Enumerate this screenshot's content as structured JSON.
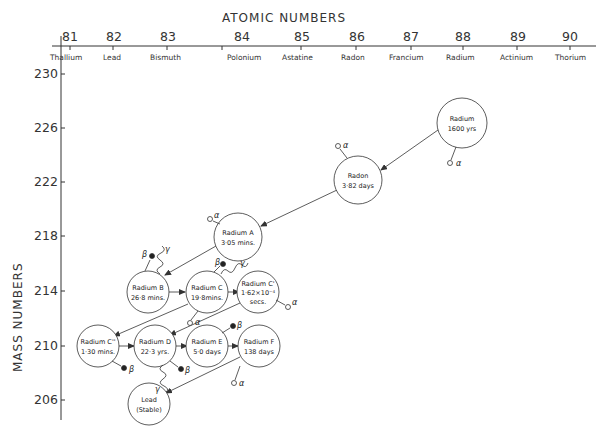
{
  "x_axis": {
    "title": "ATOMIC   NUMBERS",
    "ticks": [
      {
        "num": "81",
        "element": "Thallium",
        "x": 58
      },
      {
        "num": "82",
        "element": "Lead",
        "x": 113
      },
      {
        "num": "83",
        "element": "Bismuth",
        "x": 167
      },
      {
        "num": "84",
        "element": "Polonium",
        "x": 222
      },
      {
        "num": "85",
        "element": "Astatine",
        "x": 276
      },
      {
        "num": "86",
        "element": "Radon",
        "x": 331
      },
      {
        "num": "87",
        "element": "Francium",
        "x": 385
      },
      {
        "num": "88",
        "element": "Radium",
        "x": 437
      },
      {
        "num": "89",
        "element": "Actinium",
        "x": 491
      },
      {
        "num": "90",
        "element": "Thorium",
        "x": 544
      }
    ]
  },
  "y_axis": {
    "title": "MASS   NUMBERS",
    "ticks": [
      {
        "num": "230",
        "y": 74
      },
      {
        "num": "226",
        "y": 128
      },
      {
        "num": "222",
        "y": 182
      },
      {
        "num": "218",
        "y": 236
      },
      {
        "num": "214",
        "y": 291
      },
      {
        "num": "210",
        "y": 346
      },
      {
        "num": "206",
        "y": 400
      }
    ]
  },
  "nodes": [
    {
      "id": "radium",
      "line1": "Radium",
      "line2": "1600 yrs",
      "line3": "",
      "cx": 462,
      "cy": 123
    },
    {
      "id": "radon",
      "line1": "Radon",
      "line2": "3·82 days",
      "line3": "",
      "cx": 358,
      "cy": 180
    },
    {
      "id": "radium-a",
      "line1": "Radium A",
      "line2": "3·05 mins.",
      "line3": "",
      "cx": 238,
      "cy": 237
    },
    {
      "id": "radium-b",
      "line1": "Radium B",
      "line2": "26·8 mins.",
      "line3": "",
      "cx": 148,
      "cy": 292
    },
    {
      "id": "radium-c",
      "line1": "Radium C",
      "line2": "19·8mins.",
      "line3": "",
      "cx": 207,
      "cy": 292
    },
    {
      "id": "radium-c-prime",
      "line1": "Radium C'",
      "line2": "1·62×10⁻⁴",
      "line3": "secs.",
      "cx": 258,
      "cy": 292
    },
    {
      "id": "radium-c-double-prime",
      "line1": "Radium C''",
      "line2": "1·30 mins.",
      "line3": "",
      "cx": 98,
      "cy": 346
    },
    {
      "id": "radium-d",
      "line1": "Radium D",
      "line2": "22·3 yrs.",
      "line3": "",
      "cx": 155,
      "cy": 346
    },
    {
      "id": "radium-e",
      "line1": "Radium E",
      "line2": "5·0 days",
      "line3": "",
      "cx": 207,
      "cy": 346
    },
    {
      "id": "radium-f",
      "line1": "Radium F",
      "line2": "138 days",
      "line3": "",
      "cx": 259,
      "cy": 346
    },
    {
      "id": "lead-stable",
      "line1": "Lead",
      "line2": "(Stable)",
      "line3": "",
      "cx": 149,
      "cy": 404
    }
  ],
  "emissions": {
    "alpha": "α",
    "beta": "β",
    "gamma": "γ"
  }
}
